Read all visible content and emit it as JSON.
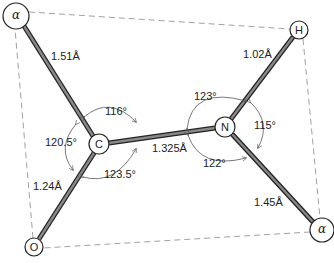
{
  "diagram": {
    "atoms": [
      {
        "id": "ca1",
        "label": "α",
        "x": 16,
        "y": 16,
        "r": 13
      },
      {
        "id": "h",
        "label": "H",
        "x": 299,
        "y": 30,
        "r": 9
      },
      {
        "id": "c",
        "label": "C",
        "x": 99,
        "y": 144,
        "r": 10
      },
      {
        "id": "n",
        "label": "N",
        "x": 225,
        "y": 127,
        "r": 10
      },
      {
        "id": "o",
        "label": "O",
        "x": 34,
        "y": 247,
        "r": 9
      },
      {
        "id": "ca2",
        "label": "α",
        "x": 322,
        "y": 230,
        "r": 12
      }
    ],
    "bonds": [
      {
        "from": "ca1",
        "to": "c",
        "length": "1.51Å"
      },
      {
        "from": "c",
        "to": "n",
        "length": "1.325Å"
      },
      {
        "from": "c",
        "to": "o",
        "length": "1.24Å"
      },
      {
        "from": "n",
        "to": "h",
        "length": "1.02Å"
      },
      {
        "from": "n",
        "to": "ca2",
        "length": "1.45Å"
      }
    ],
    "bond_labels": {
      "ca1_c": "1.51Å",
      "c_n": "1.325Å",
      "c_o": "1.24Å",
      "n_h": "1.02Å",
      "n_ca2": "1.45Å"
    },
    "angles": {
      "ca1_c_n": "116°",
      "ca1_c_o": "120.5°",
      "o_c_n": "123.5°",
      "c_n_h": "123°",
      "h_n_ca2": "115°",
      "c_n_ca2": "122°"
    },
    "atom_labels": {
      "ca1": "α",
      "h": "H",
      "c": "C",
      "n": "N",
      "o": "O",
      "ca2": "α"
    },
    "colors": {
      "bond_fill": "#777777",
      "bond_edge": "#222222",
      "plane_dash": "#888888",
      "arc": "#555555"
    }
  }
}
